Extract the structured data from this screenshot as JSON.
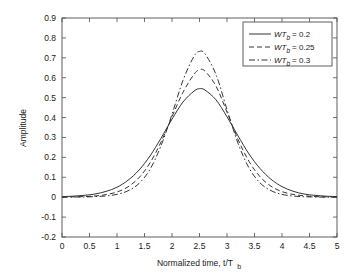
{
  "chart_data": {
    "type": "line",
    "title": "",
    "xlabel": "Normalized time, t/T b",
    "xlabel_parts": {
      "main": "Normalized time, t/T",
      "sub": "b"
    },
    "ylabel": "Amplitude",
    "xlim": [
      0,
      5
    ],
    "ylim": [
      -0.2,
      0.9
    ],
    "xticks": [
      "0",
      "0.5",
      "1",
      "1.5",
      "2",
      "2.5",
      "3",
      "3.5",
      "4",
      "4.5",
      "5"
    ],
    "xtick_values": [
      0,
      0.5,
      1,
      1.5,
      2,
      2.5,
      3,
      3.5,
      4,
      4.5,
      5
    ],
    "yticks": [
      "0.9",
      "0.8",
      "0.7",
      "0.6",
      "0.5",
      "0.4",
      "0.3",
      "0.2",
      "0.1",
      "0",
      "-0.1",
      "-0.2"
    ],
    "ytick_values": [
      0.9,
      0.8,
      0.7,
      0.6,
      0.5,
      0.4,
      0.3,
      0.2,
      0.1,
      0,
      -0.1,
      -0.2
    ],
    "grid": false,
    "legend_position": "top-right",
    "series": [
      {
        "name": "WT_b = 0.2",
        "label_prefix": "W",
        "label_italic": "T",
        "label_sub": "b",
        "label_value": "= 0.2",
        "style": "solid",
        "color": "#333333",
        "peak": 0.545,
        "peak_x": 2.5,
        "x": [
          0,
          0.2,
          0.4,
          0.6,
          0.8,
          1.0,
          1.2,
          1.4,
          1.6,
          1.8,
          2.0,
          2.2,
          2.4,
          2.5,
          2.6,
          2.8,
          3.0,
          3.2,
          3.4,
          3.6,
          3.8,
          4.0,
          4.2,
          4.4,
          4.6,
          4.8,
          5.0
        ],
        "values": [
          0.003,
          0.005,
          0.009,
          0.016,
          0.029,
          0.05,
          0.085,
          0.136,
          0.207,
          0.296,
          0.392,
          0.478,
          0.533,
          0.545,
          0.538,
          0.489,
          0.404,
          0.308,
          0.217,
          0.144,
          0.09,
          0.053,
          0.03,
          0.016,
          0.009,
          0.005,
          0.003
        ]
      },
      {
        "name": "WT_b = 0.25",
        "label_prefix": "W",
        "label_italic": "T",
        "label_sub": "b",
        "label_value": "= 0.25",
        "style": "dashed",
        "color": "#333333",
        "peak": 0.65,
        "peak_x": 2.5,
        "x": [
          0,
          0.2,
          0.4,
          0.6,
          0.8,
          1.0,
          1.2,
          1.4,
          1.6,
          1.8,
          2.0,
          2.2,
          2.4,
          2.5,
          2.6,
          2.8,
          3.0,
          3.2,
          3.4,
          3.6,
          3.8,
          4.0,
          4.2,
          4.4,
          4.6,
          4.8,
          5.0
        ],
        "values": [
          0.001,
          0.002,
          0.003,
          0.006,
          0.013,
          0.026,
          0.052,
          0.098,
          0.172,
          0.277,
          0.404,
          0.527,
          0.617,
          0.64,
          0.633,
          0.558,
          0.427,
          0.29,
          0.18,
          0.103,
          0.055,
          0.028,
          0.014,
          0.007,
          0.003,
          0.002,
          0.001
        ]
      },
      {
        "name": "WT_b = 0.3",
        "label_prefix": "W",
        "label_italic": "T",
        "label_sub": "b",
        "label_value": "= 0.3",
        "style": "dashdot",
        "color": "#333333",
        "peak": 0.735,
        "peak_x": 2.5,
        "x": [
          0,
          0.2,
          0.4,
          0.6,
          0.8,
          1.0,
          1.2,
          1.4,
          1.6,
          1.8,
          2.0,
          2.2,
          2.4,
          2.5,
          2.6,
          2.8,
          3.0,
          3.2,
          3.4,
          3.6,
          3.8,
          4.0,
          4.2,
          4.4,
          4.6,
          4.8,
          5.0
        ],
        "values": [
          0.0,
          0.001,
          0.001,
          0.003,
          0.006,
          0.014,
          0.032,
          0.069,
          0.14,
          0.258,
          0.416,
          0.587,
          0.708,
          0.732,
          0.72,
          0.616,
          0.44,
          0.271,
          0.147,
          0.072,
          0.033,
          0.014,
          0.006,
          0.002,
          0.001,
          0.0,
          0.0
        ]
      }
    ]
  }
}
